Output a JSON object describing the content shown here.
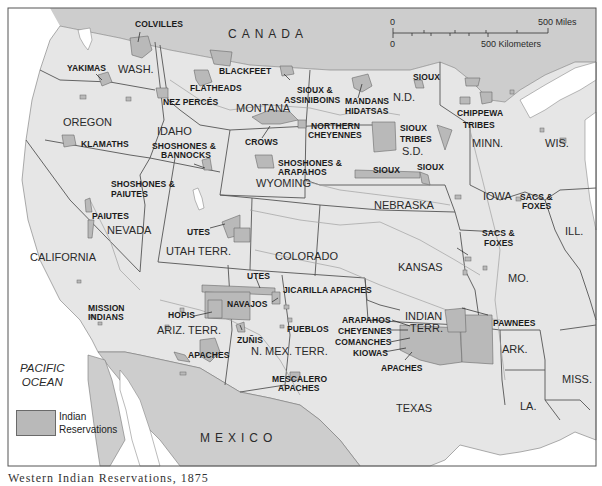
{
  "map": {
    "title": "Western Indian Reservations",
    "colors": {
      "land_us": "#e6e6e6",
      "land_foreign": "#cdcdcd",
      "water": "#ffffff",
      "reservation": "#b9b9b9",
      "border": "#555555",
      "river": "#9a9a9a"
    },
    "countries": [
      "CANADA",
      "MEXICO"
    ],
    "ocean": "PACIFIC\nOCEAN",
    "ocean_lines": [
      "PACIFIC",
      "OCEAN"
    ],
    "states": {
      "wash": "WASH.",
      "oregon": "OREGON",
      "idaho": "IDAHO",
      "montana": "MONTANA",
      "nd": "N.D.",
      "sd": "S.D.",
      "minn": "MINN.",
      "wis": "WIS.",
      "wyoming": "WYOMING",
      "nebraska": "NEBRASKA",
      "iowa": "IOWA",
      "ill": "ILL.",
      "nevada": "NEVADA",
      "utah": "UTAH TERR.",
      "colorado": "COLORADO",
      "kansas": "KANSAS",
      "mo": "MO.",
      "california": "CALIFORNIA",
      "arizona": "ARIZ. TERR.",
      "new_mexico": "N. MEX. TERR.",
      "indian_terr_1": "INDIAN",
      "indian_terr_2": "TERR.",
      "ark": "ARK.",
      "miss": "MISS.",
      "texas": "TEXAS",
      "la": "LA."
    },
    "tribes": {
      "colvilles": "COLVILLES",
      "yakimas": "YAKIMAS",
      "flatheads": "FLATHEADS",
      "blackfeet": "BLACKFEET",
      "nez_perces": "NEZ PERCÉS",
      "sioux_assiniboins_1": "SIOUX &",
      "sioux_assiniboins_2": "ASSINIBOINS",
      "mandans": "MANDANS",
      "hidatsas": "HIDATSAS",
      "sioux_nd": "SIOUX",
      "chippewa_1": "CHIPPEWA",
      "chippewa_2": "TRIBES",
      "klamaths": "KLAMATHS",
      "shoshones_bannocks_1": "SHOSHONES &",
      "shoshones_bannocks_2": "BANNOCKS",
      "crows": "CROWS",
      "northern_cheyennes_1": "NORTHERN",
      "northern_cheyennes_2": "CHEYENNES",
      "sioux_tribes_1": "SIOUX",
      "sioux_tribes_2": "TRIBES",
      "shoshones_arapahos_1": "SHOSHONES &",
      "shoshones_arapahos_2": "ARAPAHOS",
      "sioux_sd_1": "SIOUX",
      "sioux_sd_2": "SIOUX",
      "sacs_foxes_iowa_1": "SACS &",
      "sacs_foxes_iowa_2": "FOXES",
      "shoshones_paiutes_1": "SHOSHONES &",
      "shoshones_paiutes_2": "PAIUTES",
      "paiutes": "PAIUTES",
      "utes_utah": "UTES",
      "sacs_foxes_kansas_1": "SACS &",
      "sacs_foxes_kansas_2": "FOXES",
      "utes_colorado": "UTES",
      "jicarilla": "JICARILLA APACHES",
      "mission_1": "MISSION",
      "mission_2": "INDIANS",
      "hopis": "HOPIS",
      "navajos": "NAVAJOS",
      "pueblos": "PUEBLOS",
      "zunis": "ZUÑIS",
      "apaches_az": "APACHES",
      "mescalero_1": "MESCALERO",
      "mescalero_2": "APACHES",
      "arapahos": "ARAPAHOS",
      "cheyennes": "CHEYENNES",
      "comanches": "COMANCHES",
      "kiowas": "KIOWAS",
      "apaches_it": "APACHES",
      "pawnees": "PAWNEES"
    },
    "scale": {
      "zero_top": "0",
      "miles": "500 Miles",
      "zero_bottom": "0",
      "kilometers": "500 Kilometers"
    },
    "legend": {
      "label_1": "Indian",
      "label_2": "Reservations"
    },
    "caption": "Western Indian Reservations, 1875"
  }
}
